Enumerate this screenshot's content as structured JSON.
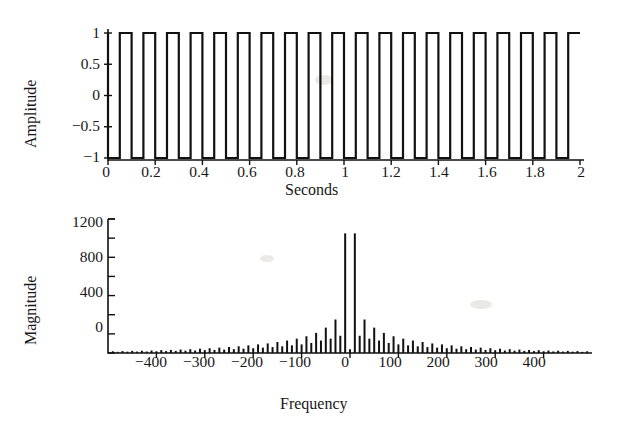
{
  "figure": {
    "kind": "two-panel-signal-figure",
    "background_color": "#ffffff",
    "ink_color": "#111111"
  },
  "chart_data": [
    {
      "type": "line",
      "id": "square-wave",
      "title": "",
      "xlabel": "Seconds",
      "ylabel": "Amplitude",
      "xlim": [
        0,
        2
      ],
      "ylim": [
        -1.15,
        1.15
      ],
      "xticks": [
        0,
        0.2,
        0.4,
        0.6,
        0.8,
        1,
        1.2,
        1.4,
        1.6,
        1.8,
        2
      ],
      "xticklabels": [
        "0",
        "0.2",
        "0.4",
        "0.6",
        "0.8",
        "1",
        "1.2",
        "1.4",
        "1.6",
        "1.8",
        "2"
      ],
      "yticks": [
        -1,
        -0.5,
        0,
        0.5,
        1
      ],
      "yticklabels": [
        "−1",
        "−0.5",
        "0",
        "0.5",
        "1"
      ],
      "grid": false,
      "legend": null,
      "series": [
        {
          "name": "square wave",
          "waveform": "square",
          "frequency_hz": 10,
          "duty_cycle": 0.5,
          "amplitude": 1,
          "offset": 0,
          "cycles_shown": 20,
          "duration_s": 2,
          "description": "Bipolar square wave alternating between +1 and -1, twenty full cycles across two seconds."
        }
      ]
    },
    {
      "type": "bar",
      "id": "magnitude-spectrum",
      "title": "",
      "xlabel": "Frequency",
      "ylabel": "Magnitude",
      "xlim": [
        -500,
        500
      ],
      "ylim": [
        0,
        1400
      ],
      "xticks": [
        -400,
        -300,
        -200,
        -100,
        0,
        100,
        200,
        300,
        400
      ],
      "xticklabels": [
        "−400",
        "−300",
        "−200",
        "−100",
        "0",
        "100",
        "200",
        "300",
        "400"
      ],
      "yticks": [
        0,
        400,
        800,
        1200
      ],
      "yticklabels": [
        "0",
        "400",
        "800",
        "1200"
      ],
      "minor_yticks": [
        200,
        600,
        1000,
        1400
      ],
      "grid": false,
      "legend": null,
      "bar_spacing_hz": 10,
      "note": "Discrete Fourier transform magnitude of the square wave; two dominant lines flank zero, odd-harmonic lines decay roughly as 1/f on both sides.",
      "x": [
        -490,
        -480,
        -470,
        -460,
        -450,
        -440,
        -430,
        -420,
        -410,
        -400,
        -390,
        -380,
        -370,
        -360,
        -350,
        -340,
        -330,
        -320,
        -310,
        -300,
        -290,
        -280,
        -270,
        -260,
        -250,
        -240,
        -230,
        -220,
        -210,
        -200,
        -190,
        -180,
        -170,
        -160,
        -150,
        -140,
        -130,
        -120,
        -110,
        -100,
        -90,
        -80,
        -70,
        -60,
        -50,
        -40,
        -30,
        -20,
        -10,
        0,
        10,
        20,
        30,
        40,
        50,
        60,
        70,
        80,
        90,
        100,
        110,
        120,
        130,
        140,
        150,
        160,
        170,
        180,
        190,
        200,
        210,
        220,
        230,
        240,
        250,
        260,
        270,
        280,
        290,
        300,
        310,
        320,
        330,
        340,
        350,
        360,
        370,
        380,
        390,
        400,
        410,
        420,
        430,
        440,
        450,
        460,
        470,
        480,
        490
      ],
      "values": [
        18,
        12,
        20,
        14,
        22,
        15,
        24,
        16,
        26,
        18,
        30,
        20,
        32,
        22,
        36,
        24,
        40,
        26,
        45,
        30,
        50,
        32,
        56,
        36,
        62,
        40,
        70,
        45,
        80,
        50,
        90,
        56,
        100,
        62,
        115,
        70,
        130,
        80,
        150,
        90,
        175,
        105,
        210,
        130,
        265,
        150,
        350,
        180,
        1250,
        40,
        1250,
        180,
        350,
        150,
        265,
        130,
        210,
        105,
        175,
        90,
        150,
        80,
        130,
        70,
        115,
        62,
        100,
        56,
        90,
        50,
        80,
        45,
        70,
        40,
        62,
        36,
        56,
        32,
        50,
        30,
        45,
        26,
        40,
        24,
        36,
        22,
        32,
        20,
        30,
        18,
        26,
        16,
        24,
        15,
        22,
        14,
        20,
        12,
        18
      ]
    }
  ]
}
